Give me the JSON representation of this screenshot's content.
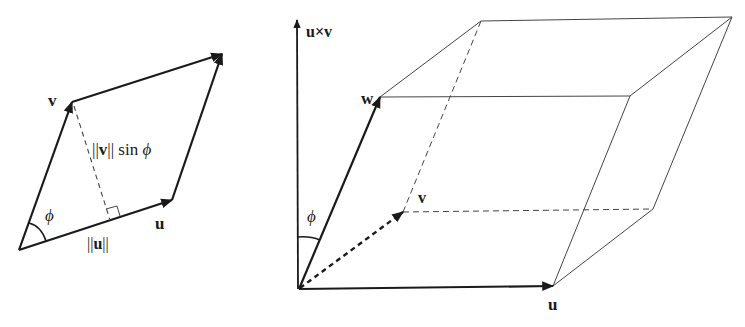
{
  "diagram": {
    "left": {
      "title": "Parallelogram spanned by u and v",
      "labels": {
        "v": "v",
        "u": "u",
        "phi": "ϕ",
        "norm_u": "||u||",
        "height_prefix": "||",
        "height_v": "v",
        "height_suffix": "|| sin ",
        "height_phi": "ϕ"
      },
      "points": {
        "origin": [
          19,
          250
        ],
        "u_tip": [
          172,
          200
        ],
        "v_tip": [
          72,
          102
        ],
        "u_plus_v": [
          222,
          54
        ],
        "foot": [
          112,
          220
        ]
      }
    },
    "right": {
      "title": "Parallelepiped spanned by u, v, w",
      "labels": {
        "uxv": "u×v",
        "w": "w",
        "v": "v",
        "u": "u",
        "phi": "ϕ"
      },
      "points": {
        "origin": [
          299,
          289
        ],
        "axis_top": [
          297,
          20
        ],
        "u_tip": [
          553,
          286
        ],
        "v_tip": [
          403,
          212
        ],
        "w_tip": [
          380,
          97
        ],
        "u_plus_v": [
          653,
          209
        ],
        "w_plus_v": [
          481,
          21
        ],
        "w_plus_u": [
          630,
          96
        ],
        "w_plus_u_plus_v": [
          732,
          17
        ]
      }
    },
    "colors": {
      "ink": "#1a1a1a",
      "thin": "#444444",
      "background": "#ffffff"
    }
  }
}
